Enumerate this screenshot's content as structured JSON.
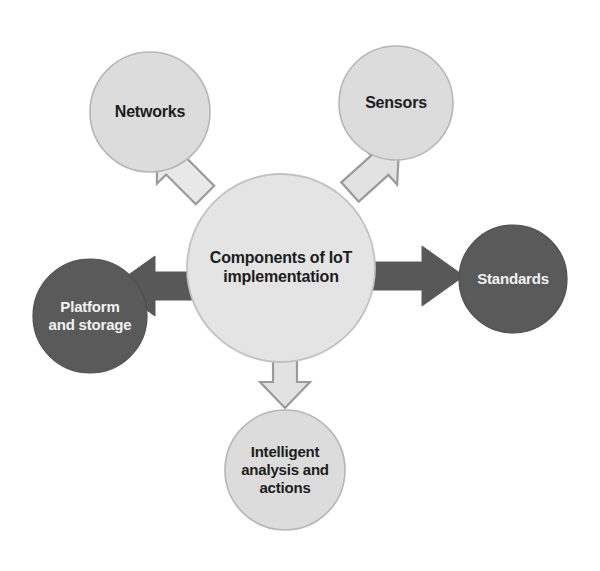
{
  "diagram": {
    "type": "hub-and-spoke",
    "background_color": "#ffffff",
    "center": {
      "id": "center-node",
      "label": "Components of IoT\nimplementation",
      "shape": "circle",
      "cx": 281,
      "cy": 268,
      "r": 94,
      "fill": "#e4e4e4",
      "stroke": "#bfbfbf",
      "text_color": "#1c1c1c",
      "font_size": 16
    },
    "nodes": [
      {
        "id": "node-networks",
        "label": "Networks",
        "shape": "circle",
        "cx": 150,
        "cy": 112,
        "r": 60,
        "fill": "#dcdcdc",
        "stroke": "#b6b6b6",
        "text_color": "#1c1c1c",
        "font_size": 16,
        "style": "light"
      },
      {
        "id": "node-sensors",
        "label": "Sensors",
        "shape": "circle",
        "cx": 396,
        "cy": 103,
        "r": 57,
        "fill": "#dcdcdc",
        "stroke": "#b6b6b6",
        "text_color": "#1c1c1c",
        "font_size": 16,
        "style": "light"
      },
      {
        "id": "node-standards",
        "label": "Standards",
        "shape": "circle",
        "cx": 513,
        "cy": 279,
        "r": 54,
        "fill": "#5a5a5a",
        "stroke": "#5a5a5a",
        "text_color": "#f2f2f2",
        "font_size": 15,
        "style": "dark"
      },
      {
        "id": "node-platform-and-storage",
        "label": "Platform\nand storage",
        "shape": "circle",
        "cx": 90,
        "cy": 316,
        "r": 57,
        "fill": "#5a5a5a",
        "stroke": "#5a5a5a",
        "text_color": "#f2f2f2",
        "font_size": 15,
        "style": "dark"
      },
      {
        "id": "node-intelligent-analysis-and-actions",
        "label": "Intelligent\nanalysis and\nactions",
        "shape": "circle",
        "cx": 285,
        "cy": 470,
        "r": 60,
        "fill": "#dcdcdc",
        "stroke": "#b6b6b6",
        "text_color": "#1c1c1c",
        "font_size": 15,
        "style": "light"
      }
    ],
    "arrows": [
      {
        "id": "arrow-to-networks",
        "from": "center-node",
        "to": "node-networks",
        "direction": "up-left",
        "style": "outline",
        "fill": "#e8e8e8",
        "stroke": "#9a9a9a"
      },
      {
        "id": "arrow-to-sensors",
        "from": "center-node",
        "to": "node-sensors",
        "direction": "up-right",
        "style": "outline",
        "fill": "#e0e0e0",
        "stroke": "#9a9a9a"
      },
      {
        "id": "arrow-to-standards",
        "from": "center-node",
        "to": "node-standards",
        "direction": "right",
        "style": "solid",
        "fill": "#585858",
        "stroke": "#585858"
      },
      {
        "id": "arrow-to-platform-and-storage",
        "from": "center-node",
        "to": "node-platform-and-storage",
        "direction": "left",
        "style": "solid",
        "fill": "#585858",
        "stroke": "#585858"
      },
      {
        "id": "arrow-to-intelligent-analysis",
        "from": "center-node",
        "to": "node-intelligent-analysis-and-actions",
        "direction": "down",
        "style": "outline",
        "fill": "#e0e0e0",
        "stroke": "#9a9a9a"
      }
    ]
  }
}
